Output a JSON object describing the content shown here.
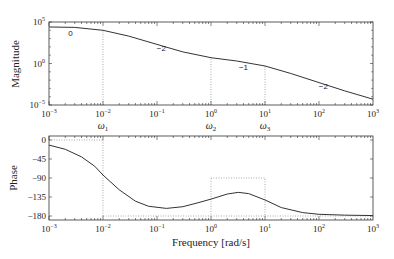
{
  "chart_data": [
    {
      "type": "line",
      "panel": "magnitude",
      "title": "",
      "xlabel": "",
      "ylabel": "Magnitude",
      "xscale": "log",
      "yscale": "log",
      "xlim": [
        0.001,
        1000
      ],
      "ylim": [
        1e-05,
        100000
      ],
      "x_tick_labels": [
        "10^-3",
        "10^-2",
        "10^-1",
        "10^0",
        "10^1",
        "10^2",
        "10^3"
      ],
      "y_tick_labels": [
        "10^5",
        "10^0",
        "10^-5"
      ],
      "grid": false,
      "legend": null,
      "series": [
        {
          "name": "|G(jw)|",
          "x": [
            0.001,
            0.003,
            0.01,
            0.03,
            0.1,
            0.3,
            1,
            3,
            10,
            30,
            100,
            300,
            1000
          ],
          "y_log10": [
            4.4,
            4.35,
            4.0,
            3.3,
            2.3,
            1.4,
            0.7,
            0.3,
            -0.3,
            -1.2,
            -2.3,
            -3.3,
            -4.3
          ]
        }
      ],
      "annotations": [
        {
          "text": "0",
          "x": 0.0025,
          "y_log10": 3.3
        },
        {
          "text": "−2",
          "x": 0.12,
          "y_log10": 1.5
        },
        {
          "text": "−1",
          "x": 4,
          "y_log10": -0.8
        },
        {
          "text": "−2",
          "x": 120,
          "y_log10": -3.1
        }
      ],
      "reference_lines": [
        {
          "x": 0.01,
          "from_log10": -5,
          "to_log10": 4.0,
          "style": "dotted"
        },
        {
          "x": 1,
          "from_log10": -5,
          "to_log10": 0.7,
          "style": "dotted"
        },
        {
          "x": 10,
          "from_log10": -5,
          "to_log10": -0.3,
          "style": "dotted"
        }
      ],
      "frequency_markers": [
        {
          "label": "ω",
          "sub": "1",
          "x": 0.01
        },
        {
          "label": "ω",
          "sub": "2",
          "x": 1
        },
        {
          "label": "ω",
          "sub": "3",
          "x": 10
        }
      ]
    },
    {
      "type": "line",
      "panel": "phase",
      "title": "",
      "xlabel": "Frequency [rad/s]",
      "ylabel": "Phase",
      "xscale": "log",
      "yscale": "linear",
      "xlim": [
        0.001,
        1000
      ],
      "ylim": [
        -185,
        5
      ],
      "x_tick_labels": [
        "10^-3",
        "10^-2",
        "10^-1",
        "10^0",
        "10^1",
        "10^2",
        "10^3"
      ],
      "y_ticks": [
        0,
        -45,
        -90,
        -135,
        -180
      ],
      "y_tick_labels": [
        "0",
        "−45",
        "−90",
        "−135",
        "−180"
      ],
      "grid": false,
      "legend": null,
      "series": [
        {
          "name": "phase",
          "x": [
            0.001,
            0.002,
            0.004,
            0.007,
            0.01,
            0.02,
            0.04,
            0.07,
            0.15,
            0.3,
            0.6,
            1,
            2,
            3.2,
            5,
            10,
            20,
            50,
            100,
            300,
            1000
          ],
          "y": [
            -12,
            -22,
            -40,
            -62,
            -83,
            -118,
            -145,
            -157,
            -162,
            -158,
            -148,
            -140,
            -128,
            -124,
            -127,
            -142,
            -160,
            -172,
            -176,
            -178,
            -179
          ]
        }
      ],
      "reference_lines": [
        {
          "type": "hline",
          "y": 0,
          "x_from": 0.001,
          "x_to": 0.01,
          "style": "dotted"
        },
        {
          "type": "vline",
          "x": 0.01,
          "y_from": 0,
          "y_to": -180,
          "style": "dotted"
        },
        {
          "type": "hline",
          "y": -180,
          "x_from": 0.01,
          "x_to": 1,
          "style": "dotted"
        },
        {
          "type": "box",
          "x_from": 1,
          "x_to": 10,
          "y_top": -90,
          "y_bottom": -180,
          "style": "dotted"
        },
        {
          "type": "hline",
          "y": -180,
          "x_from": 10,
          "x_to": 1000,
          "style": "dotted"
        }
      ]
    }
  ],
  "labels": {
    "magnitude_ylabel": "Magnitude",
    "phase_ylabel": "Phase",
    "xlabel": "Frequency [rad/s]"
  },
  "colors": {
    "curve": "#333333",
    "axes": "#333333",
    "dotted": "#888888"
  }
}
